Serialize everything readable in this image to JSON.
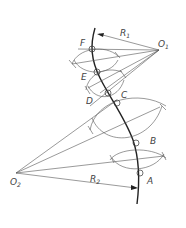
{
  "diagram": {
    "type": "geometric-construction",
    "centers": [
      {
        "name": "O1",
        "label": "O",
        "sub": "1",
        "x": 159,
        "y": 50
      },
      {
        "name": "O2",
        "label": "O",
        "sub": "2",
        "x": 16,
        "y": 173
      }
    ],
    "radii": [
      {
        "label": "R",
        "sub": "1"
      },
      {
        "label": "R",
        "sub": "2"
      }
    ],
    "points": [
      {
        "label": "F",
        "x": 92,
        "y": 49
      },
      {
        "label": "E",
        "x": 97,
        "y": 72
      },
      {
        "label": "D",
        "x": 108,
        "y": 93
      },
      {
        "label": "C",
        "x": 117,
        "y": 103
      },
      {
        "label": "B",
        "x": 136,
        "y": 143
      },
      {
        "label": "A",
        "x": 140,
        "y": 173
      }
    ],
    "colors": {
      "line": "#555555",
      "curve": "#222222",
      "label": "#444444",
      "background": "#ffffff"
    }
  }
}
